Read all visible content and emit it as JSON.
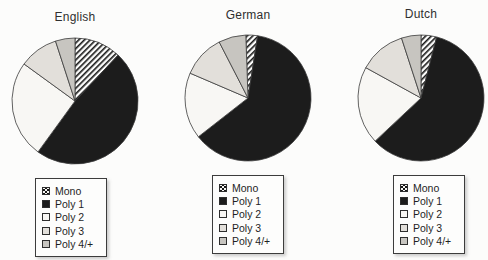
{
  "legend": {
    "items": [
      {
        "label": "Mono",
        "swatch": "hatch"
      },
      {
        "label": "Poly 1",
        "swatch": "#1c1c1c"
      },
      {
        "label": "Poly 2",
        "swatch": "#f8f7f4"
      },
      {
        "label": "Poly 3",
        "swatch": "#e2dfda"
      },
      {
        "label": "Poly 4/+",
        "swatch": "#c7c5c0"
      }
    ]
  },
  "chart_data": [
    {
      "type": "pie",
      "title": "English",
      "categories": [
        "Mono",
        "Poly 1",
        "Poly 2",
        "Poly 3",
        "Poly 4/+"
      ],
      "values": [
        12,
        48,
        25,
        10,
        5
      ],
      "unit": "percent",
      "start_angle": 0,
      "direction": "clockwise-from-top",
      "legend_position": "below"
    },
    {
      "type": "pie",
      "title": "German",
      "categories": [
        "Mono",
        "Poly 1",
        "Poly 2",
        "Poly 3",
        "Poly 4/+"
      ],
      "values": [
        3,
        62,
        17,
        11,
        7
      ],
      "unit": "percent",
      "start_angle": -2,
      "direction": "clockwise-from-top",
      "legend_position": "below"
    },
    {
      "type": "pie",
      "title": "Dutch",
      "categories": [
        "Mono",
        "Poly 1",
        "Poly 2",
        "Poly 3",
        "Poly 4/+"
      ],
      "values": [
        4,
        59,
        20,
        12,
        5
      ],
      "unit": "percent",
      "start_angle": 0,
      "direction": "clockwise-from-top",
      "legend_position": "below"
    }
  ],
  "style": {
    "slice_fills": [
      "hatch",
      "#1c1c1c",
      "#f8f7f4",
      "#e2dfda",
      "#c7c5c0"
    ],
    "slice_stroke": "#3b3b3b",
    "hatch_stripe_color": "#161616",
    "hatch_background": "#fdfdfc",
    "page_background": "#fcfcfb"
  }
}
